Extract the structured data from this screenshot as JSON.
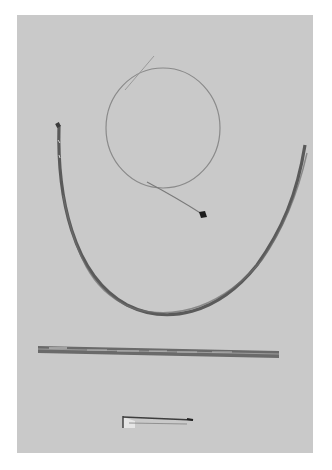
{
  "image": {
    "type": "grayscale photograph",
    "alt": "Medical catheterization devices laid out on a gray surface: a coiled guidewire with a dark tip, a long curved catheter, a straight introducer sheath/dilator, and a small connector piece",
    "background_color": "#c9c9c9",
    "page_color": "#ffffff",
    "objects": [
      {
        "name": "coiled-guidewire",
        "description": "thin wire forming a loop with a short dark tip at lower end"
      },
      {
        "name": "curved-catheter",
        "description": "long dark flexible tube forming a U-shaped curve"
      },
      {
        "name": "straight-dilator",
        "description": "straight rigid tube with markings lying horizontally"
      },
      {
        "name": "small-connector",
        "description": "short small device with a light hub near the bottom"
      }
    ]
  }
}
